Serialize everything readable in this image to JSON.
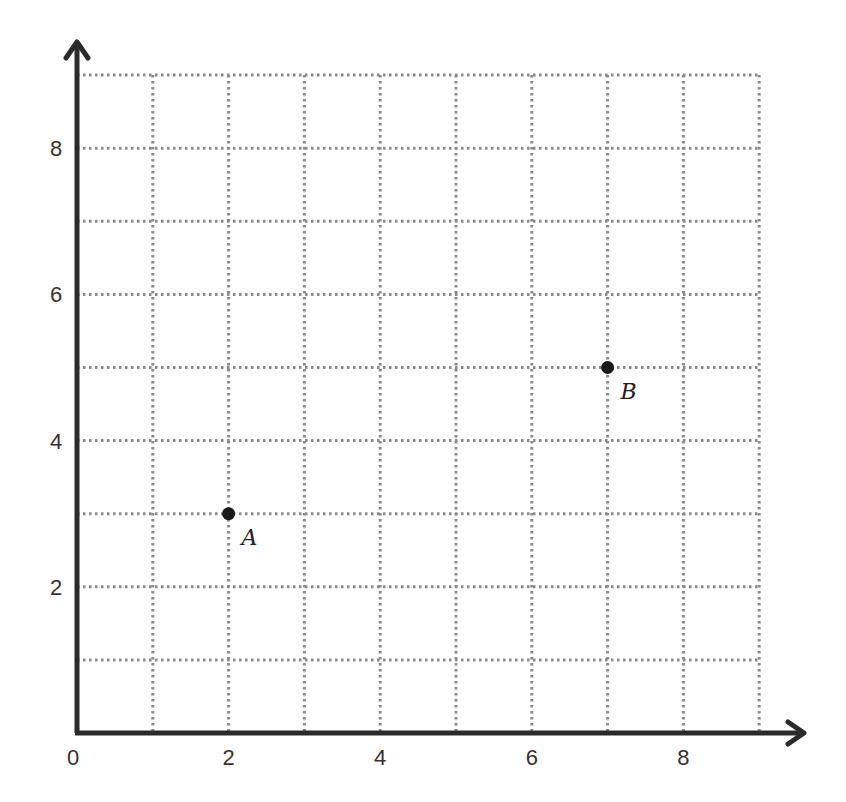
{
  "chart_data": {
    "type": "scatter",
    "title": "",
    "xlabel": "",
    "ylabel": "",
    "xlim": [
      0,
      9
    ],
    "ylim": [
      0,
      9
    ],
    "grid": true,
    "grid_style": "dotted",
    "x_ticks": [
      0,
      2,
      4,
      6,
      8
    ],
    "y_ticks": [
      2,
      4,
      6,
      8
    ],
    "x_tick_labels": [
      "0",
      "2",
      "4",
      "6",
      "8"
    ],
    "y_tick_labels": [
      "2",
      "4",
      "6",
      "8"
    ],
    "points": [
      {
        "label": "A",
        "x": 2,
        "y": 3
      },
      {
        "label": "B",
        "x": 7,
        "y": 5
      }
    ],
    "legend": null
  },
  "colors": {
    "axis": "#2b2b2b",
    "grid": "#8a8a8a",
    "point": "#1a1a1a",
    "text": "#333333"
  }
}
